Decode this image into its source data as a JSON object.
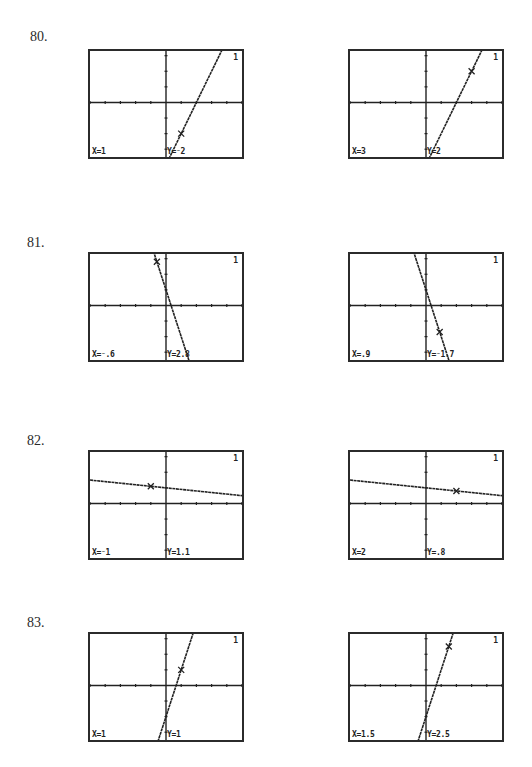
{
  "problems": [
    {
      "number": "80.",
      "function": {
        "m": 2,
        "b": -4
      },
      "screens": [
        {
          "graph_number": "1",
          "x_label": "X=1",
          "y_label": "Y=⁻2",
          "trace": {
            "x": 1,
            "y": -2
          }
        },
        {
          "graph_number": "1",
          "x_label": "X=3",
          "y_label": "Y=2",
          "trace": {
            "x": 3,
            "y": 2
          }
        }
      ]
    },
    {
      "number": "81.",
      "function": {
        "m": -3,
        "b": 1
      },
      "screens": [
        {
          "graph_number": "1",
          "x_label": "X=⁻.6",
          "y_label": "Y=2.8",
          "trace": {
            "x": -0.6,
            "y": 2.8
          }
        },
        {
          "graph_number": "1",
          "x_label": "X=.9",
          "y_label": "Y=⁻1.7",
          "trace": {
            "x": 0.9,
            "y": -1.7
          }
        }
      ]
    },
    {
      "number": "82.",
      "function": {
        "m": -0.1,
        "b": 1
      },
      "screens": [
        {
          "graph_number": "1",
          "x_label": "X=⁻1",
          "y_label": "Y=1.1",
          "trace": {
            "x": -1,
            "y": 1.1
          }
        },
        {
          "graph_number": "1",
          "x_label": "X=2",
          "y_label": "Y=.8",
          "trace": {
            "x": 2,
            "y": 0.8
          }
        }
      ]
    },
    {
      "number": "83.",
      "function": {
        "m": 3,
        "b": -2
      },
      "screens": [
        {
          "graph_number": "1",
          "x_label": "X=1",
          "y_label": "Y=1",
          "trace": {
            "x": 1,
            "y": 1
          }
        },
        {
          "graph_number": "1",
          "x_label": "X=1.5",
          "y_label": "Y=2.5",
          "trace": {
            "x": 1.5,
            "y": 2.5
          }
        }
      ]
    }
  ],
  "window": {
    "xmin": -5,
    "xmax": 5,
    "ymin": -3.5,
    "ymax": 3.3
  },
  "colors": {
    "ink": "#222222",
    "border": "#2b2b2b",
    "background": "#ffffff"
  }
}
